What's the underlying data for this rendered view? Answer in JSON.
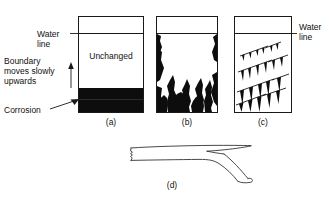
{
  "figure": {
    "background_color": "#ffffff",
    "ink_color": "#1a1a1a",
    "corrosion_color": "#0d0d0d",
    "annotations": {
      "water_line_left": "Water\nline",
      "water_line_left_l1": "Water",
      "water_line_left_l2": "line",
      "boundary_l1": "Boundary",
      "boundary_l2": "moves slowly",
      "boundary_l3": "upwards",
      "corrosion": "Corrosion",
      "water_line_right_l1": "Water",
      "water_line_right_l2": "line"
    },
    "panels": [
      {
        "id": "a",
        "caption": "(a)",
        "interior_label": "Unchanged",
        "description": "vessel with uniform corrosion layer at base and sharp horizontal boundary moving slowly upwards",
        "box": {
          "x": 78,
          "y": 16,
          "width": 66,
          "height": 97
        },
        "water_line_y": 33,
        "corrosion_top_y": 88,
        "corrosion_bottom_y": 112
      },
      {
        "id": "b",
        "caption": "(b)",
        "description": "vessel with irregular flame-shaped pitting attack rising from the base and side walls",
        "box": {
          "x": 156,
          "y": 16,
          "width": 62,
          "height": 97
        },
        "water_line_y": 33
      },
      {
        "id": "c",
        "caption": "(c)",
        "description": "vessel with inclined crack lines bearing downward pointing wedge-shaped attack",
        "box": {
          "x": 234,
          "y": 16,
          "width": 58,
          "height": 97
        },
        "water_line_y": 33
      },
      {
        "id": "d",
        "caption": "(d)",
        "description": "side view of a bar specimen necked down to a chisel edge fracture at the right end"
      }
    ]
  }
}
